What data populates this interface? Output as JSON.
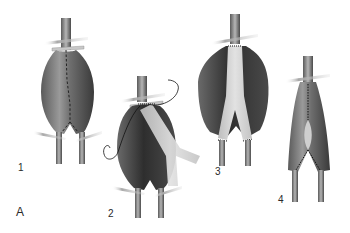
{
  "figure": {
    "panel_label": "A",
    "steps": [
      {
        "number": "1",
        "description": "aneurysm-clamped-with-incision-line"
      },
      {
        "number": "2",
        "description": "aneurysm-opened-graft-suturing-proximal"
      },
      {
        "number": "3",
        "description": "bifurcated-graft-sewn-in-sac-open"
      },
      {
        "number": "4",
        "description": "aneurysm-sac-closed-over-graft"
      }
    ]
  },
  "colors": {
    "background": "#ffffff",
    "vessel_dark": "#3a3a3a",
    "vessel_mid": "#7a7a7a",
    "vessel_light": "#c8c8c8",
    "graft": "#d6d6d6",
    "clamp": "#bdbdbd",
    "suture": "#111111",
    "label_text": "#2a2a2a"
  }
}
